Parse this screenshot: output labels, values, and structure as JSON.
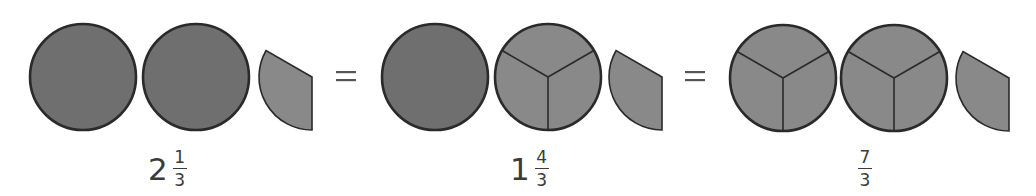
{
  "colors": {
    "solid_fill": "#6f6f6f",
    "sliced_fill": "#898989",
    "stroke": "#2a2a2a",
    "equals": "#555555"
  },
  "radius": 53,
  "groups": [
    {
      "name": "group-mixed-2-1-3",
      "shapes": [
        {
          "type": "whole",
          "cx": 83,
          "cy": 77
        },
        {
          "type": "whole",
          "cx": 196,
          "cy": 77
        },
        {
          "type": "third-slice",
          "cx": 312,
          "cy": 77
        }
      ],
      "label": {
        "whole": "2",
        "numerator": "1",
        "denominator": "3",
        "x": 148
      }
    },
    {
      "name": "group-mixed-1-4-3",
      "shapes": [
        {
          "type": "whole",
          "cx": 435,
          "cy": 77
        },
        {
          "type": "thirds",
          "cx": 548,
          "cy": 77
        },
        {
          "type": "third-slice",
          "cx": 662,
          "cy": 77
        }
      ],
      "label": {
        "whole": "1",
        "numerator": "4",
        "denominator": "3",
        "x": 510
      }
    },
    {
      "name": "group-improper-7-3",
      "shapes": [
        {
          "type": "thirds",
          "cx": 783,
          "cy": 78
        },
        {
          "type": "thirds",
          "cx": 894,
          "cy": 78
        },
        {
          "type": "third-slice",
          "cx": 1009,
          "cy": 78
        }
      ],
      "label": {
        "whole": "",
        "numerator": "7",
        "denominator": "3",
        "x": 858
      }
    }
  ],
  "equals_signs": [
    {
      "symbol": "=",
      "x": 346,
      "y": 76
    },
    {
      "symbol": "=",
      "x": 695,
      "y": 76
    }
  ]
}
